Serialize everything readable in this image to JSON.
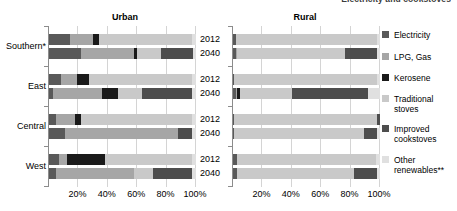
{
  "figure": {
    "top_caption": "Electricity and cookstoves",
    "panels": [
      {
        "key": "urban",
        "title": "Urban"
      },
      {
        "key": "rural",
        "title": "Rural"
      }
    ],
    "x_ticks": [
      "20%",
      "40%",
      "60%",
      "80%",
      "100%"
    ],
    "regions": [
      "Southern*",
      "East",
      "Central",
      "West"
    ],
    "years": [
      "2012",
      "2040"
    ]
  },
  "legend": {
    "items": [
      {
        "label": "Electricity",
        "color": "#595959"
      },
      {
        "label": "LPG, Gas",
        "color": "#a6a6a6"
      },
      {
        "label": "Kerosene",
        "color": "#1a1a1a"
      },
      {
        "label": "Traditional\nstoves",
        "color": "#c9c9c9"
      },
      {
        "label": "Improved\ncookstoves",
        "color": "#4d4d4d"
      },
      {
        "label": "Other\nrenewables**",
        "color": "#e0e0e0"
      }
    ]
  },
  "chart_data": {
    "type": "bar",
    "orientation": "horizontal",
    "stacked": true,
    "title": "Electricity and cookstoves",
    "xlabel": "",
    "ylabel": "",
    "xlim": [
      0,
      100
    ],
    "x_ticks": [
      20,
      40,
      60,
      80,
      100
    ],
    "x_tick_labels": [
      "20%",
      "40%",
      "60%",
      "80%",
      "100%"
    ],
    "grid": "vertical",
    "legend_position": "right",
    "categories": [
      "Electricity",
      "LPG, Gas",
      "Kerosene",
      "Traditional stoves",
      "Improved cookstoves",
      "Other renewables**"
    ],
    "category_colors": [
      "#595959",
      "#a6a6a6",
      "#1a1a1a",
      "#c9c9c9",
      "#4d4d4d",
      "#e0e0e0"
    ],
    "panels": [
      {
        "name": "Urban",
        "rows": [
          {
            "region": "Southern*",
            "year": "2012",
            "values": [
              14,
              16,
              4,
              63,
              0,
              3
            ]
          },
          {
            "region": "Southern*",
            "year": "2040",
            "values": [
              22,
              36,
              2,
              16,
              22,
              2
            ]
          },
          {
            "region": "East",
            "year": "2012",
            "values": [
              8,
              11,
              8,
              70,
              0,
              3
            ]
          },
          {
            "region": "East",
            "year": "2040",
            "values": [
              3,
              33,
              11,
              16,
              34,
              3
            ]
          },
          {
            "region": "Central",
            "year": "2012",
            "values": [
              5,
              13,
              4,
              75,
              0,
              3
            ]
          },
          {
            "region": "Central",
            "year": "2040",
            "values": [
              11,
              77,
              0,
              0,
              9,
              3
            ]
          },
          {
            "region": "West",
            "year": "2012",
            "values": [
              7,
              5,
              26,
              59,
              0,
              3
            ]
          },
          {
            "region": "West",
            "year": "2040",
            "values": [
              5,
              53,
              0,
              13,
              26,
              3
            ]
          }
        ]
      },
      {
        "name": "Rural",
        "rows": [
          {
            "region": "Southern*",
            "year": "2012",
            "values": [
              2,
              0,
              0,
              96,
              0,
              2
            ]
          },
          {
            "region": "Southern*",
            "year": "2040",
            "values": [
              2,
              1,
              0,
              73,
              22,
              2
            ]
          },
          {
            "region": "East",
            "year": "2012",
            "values": [
              1,
              0,
              0,
              97,
              0,
              2
            ]
          },
          {
            "region": "East",
            "year": "2040",
            "values": [
              2,
              1,
              2,
              35,
              52,
              8
            ]
          },
          {
            "region": "Central",
            "year": "2012",
            "values": [
              1,
              0,
              0,
              97,
              2,
              0
            ]
          },
          {
            "region": "Central",
            "year": "2040",
            "values": [
              1,
              0,
              0,
              88,
              9,
              2
            ]
          },
          {
            "region": "West",
            "year": "2012",
            "values": [
              3,
              0,
              0,
              94,
              0,
              3
            ]
          },
          {
            "region": "West",
            "year": "2040",
            "values": [
              3,
              0,
              0,
              79,
              16,
              2
            ]
          }
        ]
      }
    ]
  }
}
